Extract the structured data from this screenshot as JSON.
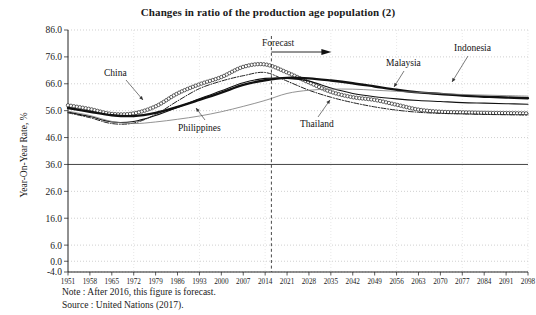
{
  "chart_data": {
    "type": "line",
    "title": "Changes in ratio of the production age population (2)",
    "xlabel": "",
    "ylabel": "Year-On-Year Rate, %",
    "xlim": [
      1951,
      2098
    ],
    "ylim": [
      -4.0,
      86.0
    ],
    "grid": true,
    "legend_position": "inline-annotations",
    "x_ticks": [
      1951,
      1958,
      1965,
      1972,
      1979,
      1986,
      1993,
      2000,
      2007,
      2014,
      2021,
      2028,
      2035,
      2042,
      2049,
      2056,
      2063,
      2070,
      2077,
      2084,
      2091,
      2098
    ],
    "y_ticks": [
      -4.0,
      0.0,
      6.0,
      16.0,
      26.0,
      36.0,
      46.0,
      56.0,
      66.0,
      76.0,
      86.0
    ],
    "y_tick_labels": [
      "-4.0",
      "0.0",
      "6.0",
      "16.0",
      "26.0",
      "36.0",
      "46.0",
      "56.0",
      "66.0",
      "76.0",
      "86.0"
    ],
    "forecast_boundary_year": 2016,
    "forecast_annotation": "Forecast",
    "emphasis_line_value": 36.0,
    "x": [
      1951,
      1958,
      1965,
      1972,
      1979,
      1986,
      1993,
      2000,
      2007,
      2014,
      2021,
      2028,
      2035,
      2042,
      2049,
      2056,
      2063,
      2070,
      2077,
      2084,
      2091,
      2098
    ],
    "series": [
      {
        "name": "China",
        "style": "circle-marker",
        "values": [
          58.0,
          56.6,
          54.8,
          55.0,
          57.6,
          62.4,
          65.8,
          68.5,
          72.3,
          73.2,
          70.2,
          66.5,
          63.0,
          61.0,
          60.0,
          58.2,
          56.4,
          55.6,
          55.4,
          55.2,
          55.1,
          55.0
        ]
      },
      {
        "name": "Indonesia",
        "style": "thick-solid",
        "values": [
          57.0,
          55.6,
          54.3,
          54.0,
          55.2,
          57.4,
          60.0,
          62.7,
          65.6,
          67.3,
          68.2,
          68.0,
          67.2,
          66.2,
          65.0,
          63.8,
          62.8,
          62.2,
          61.6,
          61.2,
          60.9,
          60.6
        ]
      },
      {
        "name": "Malaysia",
        "style": "medium-solid",
        "values": [
          55.5,
          53.8,
          51.8,
          52.0,
          54.2,
          57.2,
          60.4,
          63.4,
          66.4,
          68.0,
          68.0,
          67.0,
          64.4,
          62.4,
          61.2,
          60.4,
          59.8,
          59.4,
          59.0,
          58.8,
          58.6,
          58.4
        ]
      },
      {
        "name": "Thailand",
        "style": "dash-dot",
        "values": [
          55.2,
          53.4,
          51.2,
          51.4,
          54.6,
          59.6,
          64.2,
          67.0,
          69.0,
          70.2,
          67.0,
          63.6,
          61.0,
          59.0,
          57.4,
          56.2,
          55.4,
          55.0,
          54.8,
          54.6,
          54.5,
          54.4
        ]
      },
      {
        "name": "Philippines",
        "style": "thin-solid",
        "values": [
          55.8,
          54.2,
          52.0,
          51.2,
          51.8,
          52.8,
          54.0,
          55.6,
          57.6,
          59.8,
          62.4,
          63.6,
          64.0,
          64.0,
          63.6,
          63.2,
          62.8,
          62.4,
          62.0,
          61.8,
          61.6,
          61.4
        ]
      }
    ],
    "annotations": [
      {
        "text": "China",
        "target_series": "China"
      },
      {
        "text": "Philippines",
        "target_series": "Philippines"
      },
      {
        "text": "Thailand",
        "target_series": "Thailand"
      },
      {
        "text": "Malaysia",
        "target_series": "Malaysia"
      },
      {
        "text": "Indonesia",
        "target_series": "Indonesia"
      },
      {
        "text": "Forecast",
        "target_series": null
      }
    ]
  },
  "footnotes": {
    "note": "Note : After 2016, this figure is forecast.",
    "source": "Source : United Nations (2017)."
  }
}
